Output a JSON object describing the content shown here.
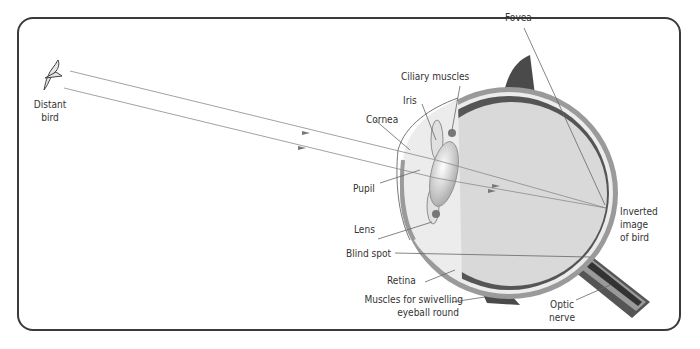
{
  "diagram": {
    "colors": {
      "frame": "#3a3a3a",
      "sclera": "#9a9a9a",
      "choroid": "#e8e8e8",
      "retina": "#555555",
      "vitreous": "#d9d9d9",
      "muscle": "#4a4a4a",
      "ray": "#8a8a8a",
      "leader": "#666666"
    },
    "labels": {
      "distant_bird": [
        "Distant",
        "bird"
      ],
      "fovea": "Fovea",
      "ciliary_muscles": "Ciliary muscles",
      "iris": "Iris",
      "cornea": "Cornea",
      "pupil": "Pupil",
      "lens": "Lens",
      "blind_spot": "Blind spot",
      "retina": "Retina",
      "muscles": [
        "Muscles for swivelling",
        "eyeball round"
      ],
      "optic_nerve": [
        "Optic",
        "nerve"
      ],
      "inverted_image": [
        "Inverted",
        "image",
        "of bird"
      ]
    }
  }
}
